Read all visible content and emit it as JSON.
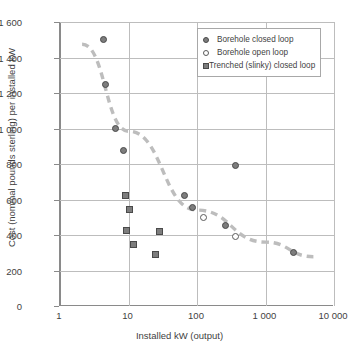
{
  "chart_data": {
    "type": "scatter",
    "title": "",
    "xlabel": "Installed kW (output)",
    "ylabel": "Cost (nominal pounds sterling) per installed kW",
    "xscale": "log",
    "yscale": "linear",
    "xlim": [
      1,
      10000
    ],
    "ylim": [
      0,
      1600
    ],
    "xticks": [
      1,
      10,
      100,
      1000,
      10000
    ],
    "xtick_labels": [
      "1",
      "10",
      "100",
      "1 000",
      "10 000"
    ],
    "yticks": [
      0,
      200,
      400,
      600,
      800,
      1000,
      1200,
      1400,
      1600
    ],
    "ytick_labels": [
      "0",
      "200",
      "400",
      "600",
      "800",
      "1 000",
      "1 200",
      "1 400",
      "1 600"
    ],
    "grid": true,
    "legend_position": "top-right",
    "series": [
      {
        "name": "Borehole closed loop",
        "marker": "filled-circle",
        "color": "#7d7d7d",
        "points": [
          {
            "x": 4.3,
            "y": 1500
          },
          {
            "x": 4.6,
            "y": 1250
          },
          {
            "x": 6.5,
            "y": 1000
          },
          {
            "x": 8.4,
            "y": 875
          },
          {
            "x": 65,
            "y": 625
          },
          {
            "x": 86,
            "y": 557
          },
          {
            "x": 260,
            "y": 452
          },
          {
            "x": 370,
            "y": 790
          },
          {
            "x": 2600,
            "y": 302
          }
        ]
      },
      {
        "name": "Borehole open loop",
        "marker": "open-circle",
        "color": "#ffffff",
        "points": [
          {
            "x": 125,
            "y": 500
          },
          {
            "x": 370,
            "y": 392
          }
        ]
      },
      {
        "name": "Trenched (slinky) closed loop",
        "marker": "filled-square",
        "color": "#7d7d7d",
        "points": [
          {
            "x": 9.0,
            "y": 620
          },
          {
            "x": 10.4,
            "y": 546
          },
          {
            "x": 9.4,
            "y": 427
          },
          {
            "x": 12.0,
            "y": 347
          },
          {
            "x": 28.0,
            "y": 421
          },
          {
            "x": 25.0,
            "y": 288
          }
        ]
      }
    ],
    "trendline": {
      "style": "dashed",
      "color": "#bdbdbd",
      "points": [
        {
          "x": 2.1,
          "y": 1475
        },
        {
          "x": 10,
          "y": 985
        },
        {
          "x": 100,
          "y": 540
        },
        {
          "x": 1000,
          "y": 360
        },
        {
          "x": 5000,
          "y": 278
        }
      ]
    }
  },
  "legend": {
    "items": [
      {
        "label": "Borehole closed loop",
        "marker": "filled-circle"
      },
      {
        "label": "Borehole open loop",
        "marker": "open-circle"
      },
      {
        "label": "Trenched (slinky) closed loop",
        "marker": "filled-square"
      }
    ]
  }
}
